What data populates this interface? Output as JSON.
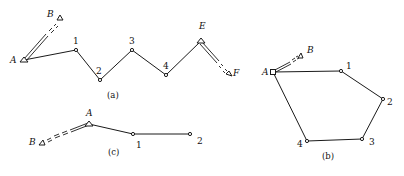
{
  "figure": {
    "panels": [
      {
        "id": "a",
        "caption": "(a)",
        "type": "connecting-traverse",
        "known_points": [
          {
            "name": "A",
            "x": 24,
            "y": 60,
            "label_x": 10,
            "label_y": 63
          },
          {
            "name": "B",
            "x": 60,
            "y": 17,
            "label_x": 47,
            "label_y": 17
          },
          {
            "name": "E",
            "x": 201,
            "y": 41,
            "label_x": 199,
            "label_y": 29
          },
          {
            "name": "F",
            "x": 230,
            "y": 74,
            "label_x": 233,
            "label_y": 76
          }
        ],
        "traverse_points": [
          {
            "name": "1",
            "x": 76,
            "y": 50,
            "label_x": 73,
            "label_y": 44
          },
          {
            "name": "2",
            "x": 100,
            "y": 80,
            "label_x": 96,
            "label_y": 74
          },
          {
            "name": "3",
            "x": 132,
            "y": 50,
            "label_x": 129,
            "label_y": 44
          },
          {
            "name": "4",
            "x": 166,
            "y": 75,
            "label_x": 163,
            "label_y": 69
          }
        ],
        "caption_pos": {
          "x": 112,
          "y": 98
        }
      },
      {
        "id": "b",
        "caption": "(b)",
        "type": "closed-traverse",
        "known_points": [
          {
            "name": "A",
            "x": 273,
            "y": 72,
            "label_x": 262,
            "label_y": 75
          },
          {
            "name": "B",
            "x": 300,
            "y": 55,
            "label_x": 307,
            "label_y": 53
          }
        ],
        "traverse_points": [
          {
            "name": "1",
            "x": 341,
            "y": 71,
            "label_x": 346,
            "label_y": 69
          },
          {
            "name": "2",
            "x": 383,
            "y": 99,
            "label_x": 387,
            "label_y": 105
          },
          {
            "name": "3",
            "x": 362,
            "y": 139,
            "label_x": 369,
            "label_y": 145
          },
          {
            "name": "4",
            "x": 307,
            "y": 141,
            "label_x": 297,
            "label_y": 147
          }
        ],
        "caption_pos": {
          "x": 328,
          "y": 159
        }
      },
      {
        "id": "c",
        "caption": "(c)",
        "type": "open-traverse",
        "known_points": [
          {
            "name": "A",
            "x": 89,
            "y": 124,
            "label_x": 86,
            "label_y": 116
          },
          {
            "name": "B",
            "x": 40,
            "y": 144,
            "label_x": 29,
            "label_y": 145
          }
        ],
        "traverse_points": [
          {
            "name": "1",
            "x": 133,
            "y": 134,
            "label_x": 136,
            "label_y": 148
          },
          {
            "name": "2",
            "x": 190,
            "y": 134,
            "label_x": 197,
            "label_y": 144
          }
        ],
        "caption_pos": {
          "x": 113,
          "y": 155
        }
      }
    ],
    "colors": {
      "line": "#1a1a1a",
      "background": "#ffffff"
    }
  }
}
